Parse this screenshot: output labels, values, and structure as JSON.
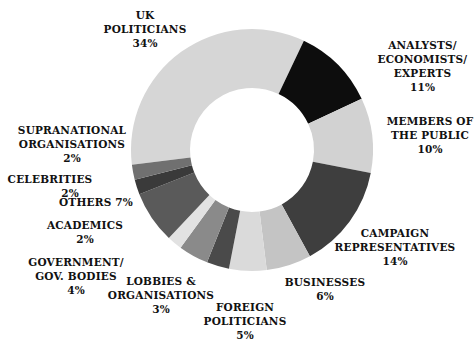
{
  "chart_data": {
    "type": "pie",
    "subtype": "donut",
    "title": "",
    "start_angle_deg": -97,
    "direction": "clockwise",
    "center": [
      252,
      150
    ],
    "outer_radius": 121,
    "inner_radius": 62,
    "slices": [
      {
        "label": "UK POLITICIANS",
        "value": 34,
        "pct_label": "34%",
        "color": "#d6d6d6"
      },
      {
        "label": "ANALYSTS/ ECONOMISTS/ EXPERTS",
        "value": 11,
        "pct_label": "11%",
        "color": "#0d0d0d"
      },
      {
        "label": "MEMBERS OF THE PUBLIC",
        "value": 10,
        "pct_label": "10%",
        "color": "#d2d2d2"
      },
      {
        "label": "CAMPAIGN REPRESENTATIVES",
        "value": 14,
        "pct_label": "14%",
        "color": "#3e3e3e"
      },
      {
        "label": "BUSINESSES",
        "value": 6,
        "pct_label": "6%",
        "color": "#c4c4c4"
      },
      {
        "label": "FOREIGN POLITICIANS",
        "value": 5,
        "pct_label": "5%",
        "color": "#dadada"
      },
      {
        "label": "LOBBIES & ORGANISATIONS",
        "value": 3,
        "pct_label": "3%",
        "color": "#4a4a4a"
      },
      {
        "label": "GOVERNMENT/ GOV. BODIES",
        "value": 4,
        "pct_label": "4%",
        "color": "#8a8a8a"
      },
      {
        "label": "ACADEMICS",
        "value": 2,
        "pct_label": "2%",
        "color": "#e2e2e2"
      },
      {
        "label": "OTHERS",
        "value": 7,
        "pct_label": "7%",
        "color": "#5a5a5a"
      },
      {
        "label": "CELEBRITIES",
        "value": 2,
        "pct_label": "2%",
        "color": "#3a3a3a"
      },
      {
        "label": "SUPRANATIONAL ORGANISATIONS",
        "value": 2,
        "pct_label": "2%",
        "color": "#707070"
      }
    ],
    "legend": "none (labels placed around the donut)"
  },
  "labels": {
    "uk_politicians": {
      "line1": "UK",
      "line2": "POLITICIANS",
      "pct": "34%"
    },
    "analysts": {
      "line1": "ANALYSTS/",
      "line2": "ECONOMISTS/",
      "line3": "EXPERTS",
      "pct": "11%"
    },
    "public": {
      "line1": "MEMBERS OF",
      "line2": "THE PUBLIC",
      "pct": "10%"
    },
    "campaign": {
      "line1": "CAMPAIGN",
      "line2": "REPRESENTATIVES",
      "pct": "14%"
    },
    "businesses": {
      "line1": "BUSINESSES",
      "pct": "6%"
    },
    "foreign": {
      "line1": "FOREIGN",
      "line2": "POLITICIANS",
      "pct": "5%"
    },
    "lobbies": {
      "line1": "LOBBIES &",
      "line2": "ORGANISATIONS",
      "pct": "3%"
    },
    "government": {
      "line1": "GOVERNMENT/",
      "line2": "GOV. BODIES",
      "pct": "4%"
    },
    "academics": {
      "line1": "ACADEMICS",
      "pct": "2%"
    },
    "others": {
      "line1": "OTHERS",
      "pct": "7%"
    },
    "celebrities": {
      "line1": "CELEBRITIES",
      "pct": "2%"
    },
    "supranational": {
      "line1": "SUPRANATIONAL",
      "line2": "ORGANISATIONS",
      "pct": "2%"
    }
  }
}
